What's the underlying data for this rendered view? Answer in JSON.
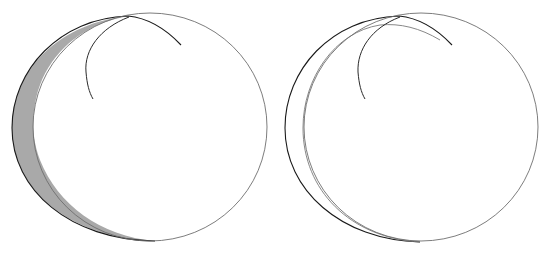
{
  "figure": {
    "panels": [
      {
        "id": "left",
        "crescent_shaded": true,
        "colors": {
          "crescent_fill": "#a9a9a9",
          "outer_arc": "#1a1a1a",
          "circle": "#6e6e6e",
          "inner_arc": "#2a2a2a"
        }
      },
      {
        "id": "right",
        "crescent_shaded": false,
        "colors": {
          "crescent_fill": "none",
          "outer_arc": "#1a1a1a",
          "circle": "#6e6e6e",
          "inner_arc": "#2a2a2a"
        }
      }
    ]
  }
}
